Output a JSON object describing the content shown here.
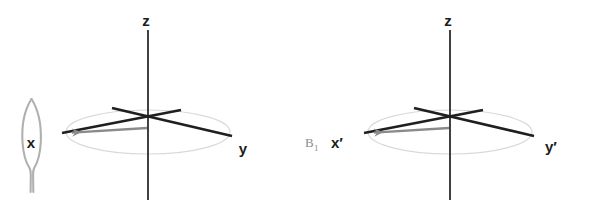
{
  "figure": {
    "title": "",
    "caption": "",
    "background_color": "#ffffff",
    "width": 595,
    "height": 208
  },
  "colors": {
    "axis_dark": "#1f1f1f",
    "axis_label": "#1b1b1b",
    "ellipse_gray": "#d9d9d9",
    "arrow_gray": "#8a8a8a",
    "annotation_gray": "#b0b0b0",
    "field_label_gray": "#8d8d8d",
    "background": "#ffffff"
  },
  "panels": [
    {
      "id": "laboratory-frame",
      "name": "left-panel",
      "origin": {
        "x": 148,
        "y": 128
      },
      "axes": [
        {
          "name": "z-axis",
          "label": "z",
          "label_x": 146,
          "label_y": 26,
          "direction": "vertical",
          "x1": 148,
          "y1": 30,
          "x2": 148,
          "y2": 200,
          "color": "#1f1f1f",
          "width": 1.6,
          "arrowhead": false
        },
        {
          "name": "y-axis",
          "label": "y",
          "label_x": 243,
          "label_y": 154,
          "direction": "down-right",
          "x1": 112,
          "y1": 108,
          "x2": 232,
          "y2": 136,
          "color": "#1f1f1f",
          "width": 2.6,
          "arrowhead": false
        },
        {
          "name": "x-axis",
          "label": "x",
          "label_x": 31,
          "label_y": 148,
          "direction": "down-left",
          "x1": 181,
          "y1": 110,
          "x2": 62,
          "y2": 133,
          "color": "#1f1f1f",
          "width": 2.6,
          "arrowhead": false
        }
      ],
      "arrow": {
        "name": "x-axis-arrow",
        "label": "",
        "x1": 147,
        "y1": 128,
        "x2": 64,
        "y2": 133,
        "color": "#8a8a8a",
        "width": 2.2,
        "arrowhead": true
      },
      "ellipse": {
        "name": "transverse-plane-ellipse",
        "cx": 148,
        "cy": 132,
        "rx": 82,
        "ry": 22,
        "stroke": "#d9d9d9",
        "width": 1.2
      },
      "annotation": {
        "name": "x-label-lens-annotation",
        "present": true,
        "description": "hand-drawn lens outline enclosing x label with downward tail",
        "stroke": "#b0b0b0",
        "width": 2.0
      }
    },
    {
      "id": "rotating-frame",
      "name": "right-panel",
      "origin": {
        "x": 450,
        "y": 128
      },
      "axes": [
        {
          "name": "z-axis",
          "label": "z",
          "label_x": 448,
          "label_y": 26,
          "direction": "vertical",
          "x1": 450,
          "y1": 30,
          "x2": 450,
          "y2": 200,
          "color": "#1f1f1f",
          "width": 1.6,
          "arrowhead": false
        },
        {
          "name": "y-prime-axis",
          "label": "y′",
          "label_x": 551,
          "label_y": 152,
          "direction": "down-right",
          "x1": 414,
          "y1": 108,
          "x2": 534,
          "y2": 136,
          "color": "#1f1f1f",
          "width": 2.6,
          "arrowhead": false
        },
        {
          "name": "x-prime-axis",
          "label": "x′",
          "label_x": 337,
          "label_y": 148,
          "direction": "down-left",
          "x1": 483,
          "y1": 110,
          "x2": 364,
          "y2": 133,
          "color": "#1f1f1f",
          "width": 2.6,
          "arrowhead": false
        }
      ],
      "arrow": {
        "name": "b1-field-arrow",
        "label": "B₁",
        "x1": 449,
        "y1": 128,
        "x2": 366,
        "y2": 133,
        "color": "#8a8a8a",
        "width": 2.2,
        "arrowhead": true
      },
      "ellipse": {
        "name": "transverse-plane-ellipse",
        "cx": 450,
        "cy": 132,
        "rx": 82,
        "ry": 22,
        "stroke": "#d9d9d9",
        "width": 1.2
      },
      "field_label": {
        "name": "b1-label",
        "base": "B",
        "subscript": "1",
        "x": 305,
        "y": 147,
        "color": "#8d8d8d"
      }
    }
  ]
}
